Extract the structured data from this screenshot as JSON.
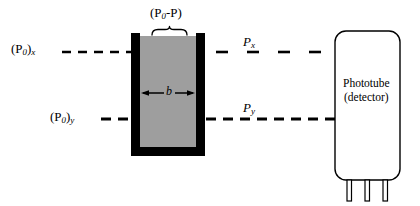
{
  "figure": {
    "background_color": "#ffffff",
    "line_color": "#000000",
    "cuvette_wall_color": "#000000",
    "cuvette_fill_color": "#9e9e9e",
    "phototube_fill_color": "#ffffff"
  },
  "labels": {
    "incident_beam_x": {
      "base": "(P",
      "sub0": "0",
      "close": ")",
      "axis": "x"
    },
    "incident_beam_y": {
      "base": "(P",
      "sub0": "0",
      "close": ")",
      "axis": "y"
    },
    "absorbed_bracket": {
      "open": "(P",
      "sub0": "0",
      "minus": "-P)"
    },
    "transmitted_x": {
      "base": "P",
      "axis": "x"
    },
    "transmitted_y": {
      "base": "P",
      "axis": "y"
    },
    "path_length": "b"
  },
  "detector": {
    "name": "Phototube",
    "qualifier": "(detector)",
    "pin_count": 3
  },
  "beams": {
    "upper_label_text": "(P0)x",
    "lower_label_text": "(P0)y",
    "upper_transmitted_text": "Px",
    "lower_transmitted_text": "Py"
  },
  "geometry": {
    "cuvette_left": 131,
    "cuvette_right": 205,
    "cuvette_top": 33,
    "cuvette_bottom": 156,
    "wall_thickness": 9,
    "upper_beam_y": 52,
    "lower_beam_y": 119,
    "phototube_left": 335,
    "phototube_right": 400,
    "phototube_top": 31,
    "phototube_bottom": 180
  }
}
